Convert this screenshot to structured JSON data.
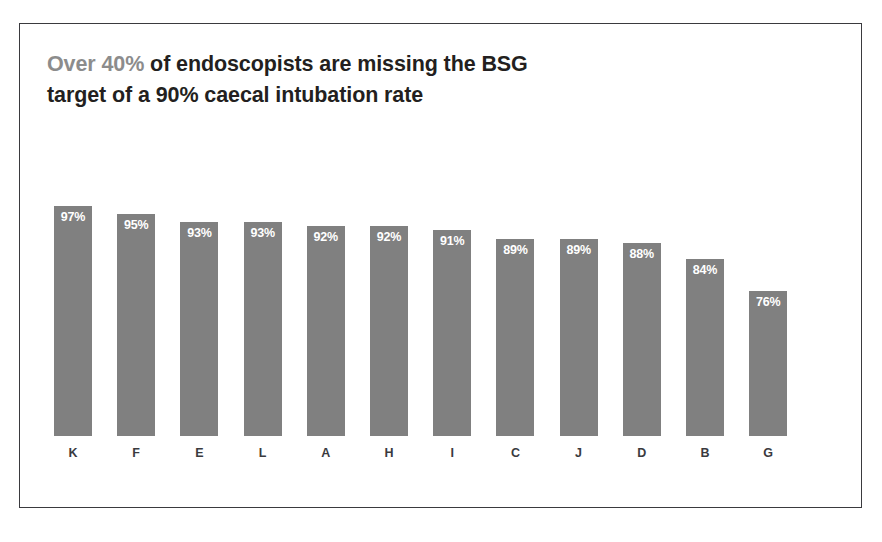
{
  "frame": {
    "border_color": "#3a3a3e",
    "background": "#ffffff"
  },
  "title": {
    "line1_accent": "Over 40%",
    "line1_rest": " of endoscopists are missing the BSG",
    "line2": "target of a 90% caecal intubation rate",
    "accent_color": "#8c8c8c",
    "text_color": "#231f20"
  },
  "chart_data": {
    "type": "bar",
    "title": "Over 40% of endoscopists are missing the BSG target of a 90% caecal intubation rate",
    "xlabel": "",
    "ylabel": "",
    "categories": [
      "K",
      "F",
      "E",
      "L",
      "A",
      "H",
      "I",
      "C",
      "J",
      "D",
      "B",
      "G"
    ],
    "values": [
      97,
      95,
      93,
      93,
      92,
      92,
      91,
      89,
      89,
      88,
      84,
      76
    ],
    "value_labels": [
      "97%",
      "95%",
      "93%",
      "93%",
      "92%",
      "92%",
      "91%",
      "89%",
      "89%",
      "88%",
      "84%",
      "76%"
    ],
    "unit": "%",
    "ylim": [
      40,
      105
    ],
    "grid": false,
    "legend": false,
    "bar_color": "#808080",
    "value_label_color": "#ffffff",
    "category_label_color": "#3a3a3e",
    "reference_target": 90,
    "orientation": "vertical",
    "sorted": "descending"
  }
}
